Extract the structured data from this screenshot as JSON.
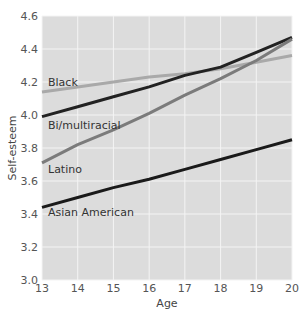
{
  "chart_data": {
    "type": "line",
    "title": "",
    "xlabel": "Age",
    "ylabel": "Self-esteem",
    "x": [
      13,
      14,
      15,
      16,
      17,
      18,
      19,
      20
    ],
    "xlim": [
      13,
      20
    ],
    "ylim": [
      3.0,
      4.6
    ],
    "xticks": [
      "13",
      "14",
      "15",
      "16",
      "17",
      "18",
      "19",
      "20"
    ],
    "yticks": [
      "3.0",
      "3.2",
      "3.4",
      "3.6",
      "3.8",
      "4.0",
      "4.2",
      "4.4",
      "4.6"
    ],
    "grid": true,
    "legend_position": "inline labels",
    "series": [
      {
        "name": "Black",
        "color": "#a9a9a9",
        "values": [
          4.14,
          4.17,
          4.2,
          4.23,
          4.25,
          4.28,
          4.32,
          4.36
        ],
        "label_pos": {
          "x": 48,
          "y": 86
        }
      },
      {
        "name": "Bi/multiracial",
        "color": "#222222",
        "values": [
          3.99,
          4.05,
          4.11,
          4.17,
          4.24,
          4.29,
          4.38,
          4.47
        ],
        "label_pos": {
          "x": 48,
          "y": 129
        }
      },
      {
        "name": "Latino",
        "color": "#7b7b7b",
        "values": [
          3.71,
          3.82,
          3.91,
          4.01,
          4.12,
          4.22,
          4.33,
          4.46
        ],
        "label_pos": {
          "x": 48,
          "y": 173
        }
      },
      {
        "name": "Asian American",
        "color": "#1a1a1a",
        "values": [
          3.44,
          3.5,
          3.56,
          3.61,
          3.67,
          3.73,
          3.79,
          3.85
        ],
        "label_pos": {
          "x": 48,
          "y": 216
        }
      }
    ]
  },
  "colors": {
    "plot_background": "#dcdcdc",
    "gridline": "#f4f4f4"
  }
}
